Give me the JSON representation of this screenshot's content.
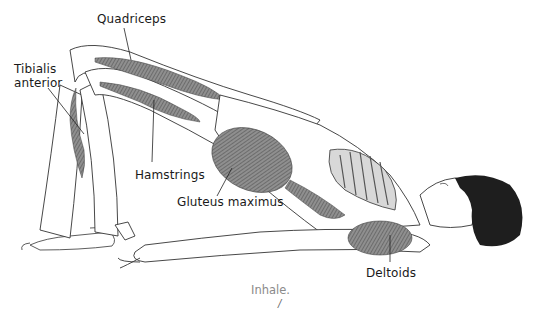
{
  "figure": {
    "labels": {
      "quadriceps": "Quadriceps",
      "tibialis_line1": "Tibialis",
      "tibialis_line2": "anterior",
      "hamstrings": "Hamstrings",
      "gluteus": "Gluteus maximus",
      "deltoids": "Deltoids"
    },
    "caption": "Inhale.",
    "page_mark": "/",
    "colors": {
      "line": "#333333",
      "muscle": "#6e6e6e",
      "muscle_light": "#bdbdbd",
      "caption": "#8a8a8a",
      "hair": "#1e1e1e"
    }
  }
}
